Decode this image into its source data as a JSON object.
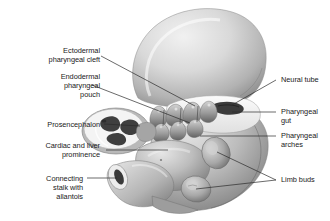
{
  "figure": {
    "type": "anatomical-illustration",
    "background_color": "#ffffff",
    "line_color": "#2b2b2b",
    "text_color": "#1a1a1a",
    "palette": {
      "tissue_light": "#e3e3e3",
      "tissue_mid": "#b6b6b6",
      "tissue_dark": "#7c7c7c",
      "tissue_shadow": "#545454",
      "lumen_dark": "#3a3a3a",
      "cut_surface": "#f2f2f2"
    }
  },
  "labels_left": [
    {
      "id": "ectodermal-pharyngeal-cleft",
      "text": "Ectodermal\npharyngeal cleft"
    },
    {
      "id": "endodermal-pharyngeal-pouch",
      "text": "Endodermal\npharyngeal\npouch"
    },
    {
      "id": "prosencephalon",
      "text": "Prosencephalon"
    },
    {
      "id": "cardiac-and-liver-prominence",
      "text": "Cardiac and liver\nprominence"
    },
    {
      "id": "connecting-stalk-with-allantois",
      "text": "Connecting\nstalk with\nallantois"
    }
  ],
  "labels_right": [
    {
      "id": "neural-tube",
      "text": "Neural tube"
    },
    {
      "id": "pharyngeal-gut",
      "text": "Pharyngeal\ngut"
    },
    {
      "id": "pharyngeal-arches",
      "text": "Pharyngeal\narches"
    },
    {
      "id": "limb-buds",
      "text": "Limb buds"
    }
  ]
}
